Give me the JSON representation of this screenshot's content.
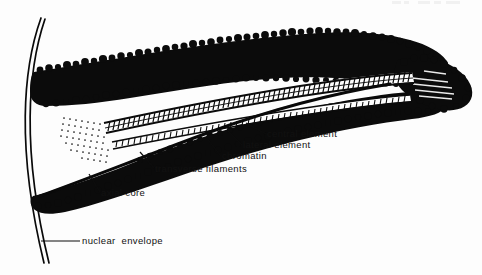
{
  "figure": {
    "background_color": "#fdfdfd",
    "ink_color": "#0b0b0b",
    "width": 482,
    "height": 275
  },
  "header": {
    "fragment_text": "",
    "note": "faint cut-off page header at top right edge"
  },
  "labels": [
    {
      "id": "central-element",
      "text": "central element",
      "text_x": 267,
      "text_y": 137,
      "leader": "M 266 134 L 246 123",
      "anchor": "start"
    },
    {
      "id": "lateral-element",
      "text": "lateral element",
      "text_x": 243,
      "text_y": 148,
      "leader": "M 242 145 L 228 131",
      "anchor": "start"
    },
    {
      "id": "chromatin",
      "text": "chromatin",
      "text_x": 222,
      "text_y": 159,
      "leader": "M 221 156 L 208 140",
      "anchor": "start"
    },
    {
      "id": "transverse-filaments",
      "text": "transverse filaments",
      "text_x": 155,
      "text_y": 172,
      "leader": "M 154 168 L 140 152",
      "anchor": "start"
    },
    {
      "id": "axial-core",
      "text": "axial core",
      "text_x": 101,
      "text_y": 196,
      "leader": "M 100 192 L 89 174",
      "anchor": "start"
    },
    {
      "id": "nuclear-envelope",
      "text": "nuclear  envelope",
      "text_x": 82,
      "text_y": 244,
      "leader": "M 80 241 L 41 241",
      "anchor": "start"
    }
  ],
  "structures": {
    "nuclear_envelope": {
      "name": "nuclear-envelope-curve",
      "outer_path": "M 41 18 C 22 70 16 150 44 262",
      "inner_path": "M 45 19 C 27 71 21 150 48 262"
    },
    "upper_chromatin_arm": {
      "name": "upper-chromatin-arm",
      "description": "upper dense chromatin mass sweeping from lower-left to upper-right"
    },
    "lower_chromatin_arm": {
      "name": "lower-chromatin-arm",
      "description": "lower dense chromatin mass sweeping from lower-left to upper-right"
    },
    "axial_core": {
      "name": "axial-core-strand",
      "description": "thick dark line running through the lower arm"
    },
    "ladder": {
      "name": "transverse-filament-ladder",
      "description": "ladder-like rungs between the two lateral elements",
      "rung_count": 78
    },
    "stipple_fan": {
      "name": "stippled-fan-region",
      "description": "dotted fan where the complex opens at the left"
    },
    "right_terminus": {
      "name": "right-terminus-mass",
      "description": "dense tapering chromatin knob at right end"
    }
  }
}
